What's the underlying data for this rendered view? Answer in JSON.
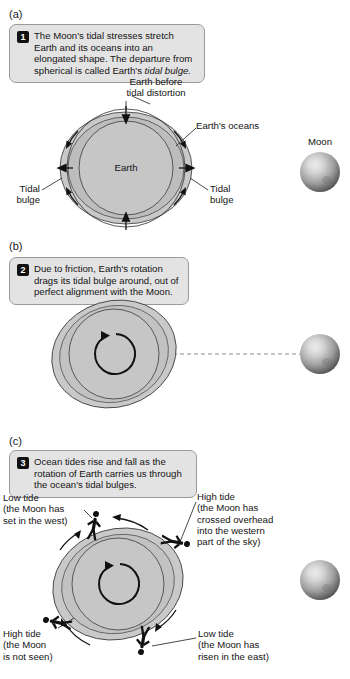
{
  "figure": {
    "title_alt": "Tidal bulge and ocean tides diagram",
    "panels": [
      {
        "letter": "(a)",
        "step": "1",
        "caption": "The Moon's tidal stresses stretch Earth and its oceans into an elongated shape. The departure from spherical is called Earth's ",
        "caption_italic": "tidal bulge.",
        "labels": {
          "earth_before": "Earth before\ntidal distortion",
          "oceans": "Earth's oceans",
          "earth": "Earth",
          "bulge_left": "Tidal\nbulge",
          "bulge_right": "Tidal\nbulge",
          "moon": "Moon"
        }
      },
      {
        "letter": "(b)",
        "step": "2",
        "caption": "Due to friction, Earth's rotation drags its tidal bulge around, out of perfect alignment with the Moon."
      },
      {
        "letter": "(c)",
        "step": "3",
        "caption": "Ocean tides rise and fall as the rotation of Earth carries us through the ocean's tidal bulges.",
        "labels": {
          "top_left": "Low tide\n(the Moon has\nset in the west)",
          "top_right": "High tide\n(the Moon has\ncrossed overhead\ninto the western\npart of the sky)",
          "bottom_left": "High tide\n(the Moon\nis not seen)",
          "bottom_right": "Low tide\n(the Moon has\nrisen in the east)"
        }
      }
    ],
    "colors": {
      "callout_fill": "#e3e3e3",
      "callout_border": "#9a9a9a",
      "badge_fill": "#111111",
      "bulge_fill": "#c9c9c9",
      "ocean_fill": "#c0c0c0",
      "earth_fill": "#c4c4c4",
      "outline": "#3a3a3a",
      "moon_light": "#e8e8e8",
      "moon_mid": "#9a9a9a",
      "moon_dark": "#4a4a4a",
      "text": "#141414"
    }
  }
}
